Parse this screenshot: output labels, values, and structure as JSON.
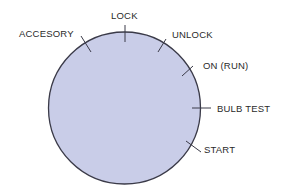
{
  "diagram": {
    "type": "ignition-switch-positions",
    "dial": {
      "fill": "#c9cde8",
      "stroke": "#3a3a48"
    },
    "positions": [
      {
        "id": "accesory",
        "label": "ACCESORY"
      },
      {
        "id": "lock",
        "label": "LOCK"
      },
      {
        "id": "unlock",
        "label": "UNLOCK"
      },
      {
        "id": "on-run",
        "label": "ON (RUN)"
      },
      {
        "id": "bulb-test",
        "label": "BULB TEST"
      },
      {
        "id": "start",
        "label": "START"
      }
    ]
  }
}
